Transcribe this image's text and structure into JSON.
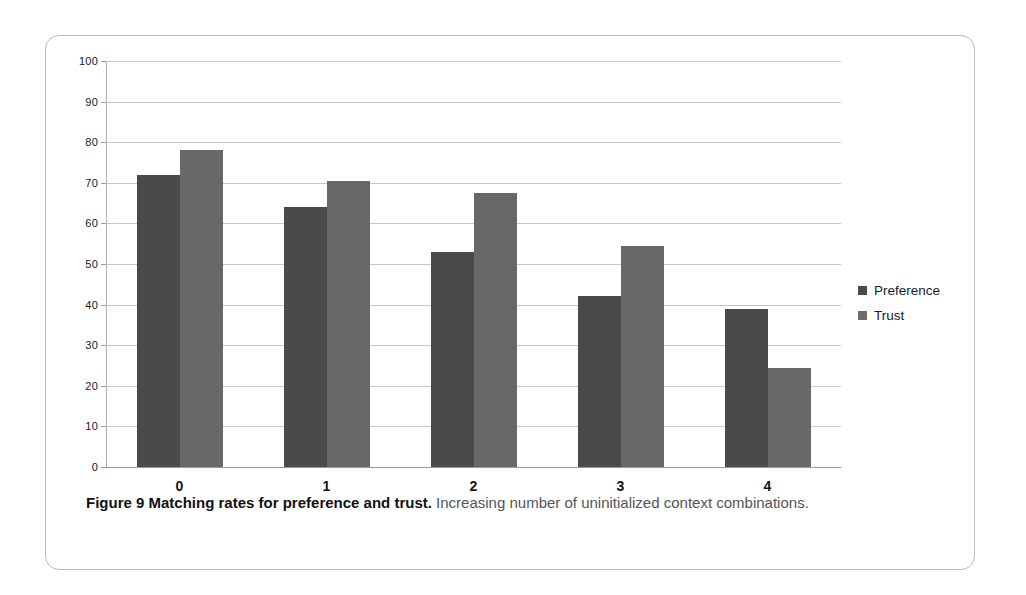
{
  "figure": {
    "caption_bold": "Figure 9 Matching rates for preference and trust.",
    "caption_rest": " Increasing number of uninitialized context combinations."
  },
  "colors": {
    "preference": "#4a4a4a",
    "trust": "#686868",
    "gridline": "#c8c8c8",
    "frame": "#b9b9b9"
  },
  "chart_data": {
    "type": "bar",
    "title": "",
    "xlabel": "",
    "ylabel": "",
    "categories": [
      "0",
      "1",
      "2",
      "3",
      "4"
    ],
    "series": [
      {
        "name": "Preference",
        "values": [
          72,
          64,
          53,
          42,
          39
        ]
      },
      {
        "name": "Trust",
        "values": [
          78,
          70.5,
          67.5,
          54.5,
          24.5
        ]
      }
    ],
    "ylim": [
      0,
      100
    ],
    "ytick_step": 10,
    "yticks": [
      0,
      10,
      20,
      30,
      40,
      50,
      60,
      70,
      80,
      90,
      100
    ],
    "ytick_labels": [
      "0",
      "10",
      "20",
      "30",
      "40",
      "50",
      "60",
      "70",
      "80",
      "90",
      "100"
    ],
    "grid": "horizontal",
    "legend_position": "right",
    "legend": [
      "Preference",
      "Trust"
    ]
  }
}
